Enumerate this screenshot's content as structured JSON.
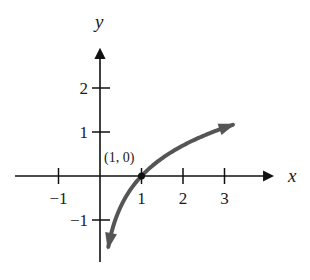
{
  "chart_data": {
    "type": "line",
    "title": "",
    "xlabel": "x",
    "ylabel": "y",
    "function": "y = ln x",
    "xlim": [
      -1.9,
      4.2
    ],
    "ylim": [
      -2.0,
      3.0
    ],
    "x_ticks": [
      -1,
      1,
      2,
      3
    ],
    "x_tick_labels": [
      "−1",
      "1",
      "2",
      "3"
    ],
    "y_ticks": [
      -1,
      1,
      2
    ],
    "y_tick_labels": [
      "−1",
      "1",
      "2"
    ],
    "series": [
      {
        "name": "ln x",
        "color": "#555555",
        "domain": [
          0.2,
          3.2
        ],
        "arrows": "both",
        "x": [
          0.2,
          0.3,
          0.4,
          0.5,
          0.6,
          0.8,
          1.0,
          1.25,
          1.5,
          2.0,
          2.5,
          3.0,
          3.2
        ],
        "y": [
          -1.61,
          -1.2,
          -0.92,
          -0.69,
          -0.51,
          -0.22,
          0.0,
          0.22,
          0.41,
          0.69,
          0.92,
          1.1,
          1.16
        ]
      }
    ],
    "annotations": [
      {
        "text": "(1, 0)",
        "x": 1,
        "y": 0,
        "marker": "point"
      }
    ],
    "grid": false,
    "legend": "none"
  }
}
